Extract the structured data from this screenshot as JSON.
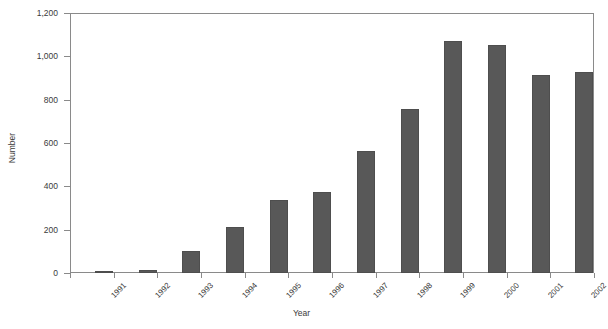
{
  "chart_data": {
    "type": "bar",
    "title": "",
    "subtitle": "",
    "xlabel": "Year",
    "ylabel": "Number",
    "categories": [
      "1991",
      "1992",
      "1993",
      "1994",
      "1995",
      "1996",
      "1997",
      "1998",
      "1999",
      "2000",
      "2001",
      "2002"
    ],
    "values": [
      10,
      14,
      101,
      212,
      337,
      372,
      562,
      757,
      1070,
      1052,
      913,
      930
    ],
    "ylim": [
      0,
      1200
    ],
    "yticks": [
      0,
      200,
      400,
      600,
      800,
      1000,
      1200
    ],
    "ytick_labels": [
      "0",
      "200",
      "400",
      "600",
      "800",
      "1,000",
      "1,200"
    ],
    "grid": false,
    "legend": false,
    "legend_position": "none",
    "bar_color": "#585858",
    "bar_edge_color": "#4e4e4e",
    "axis_color": "#8a8a8a",
    "text_color": "#3a3a3a",
    "background_color": "#ffffff"
  }
}
